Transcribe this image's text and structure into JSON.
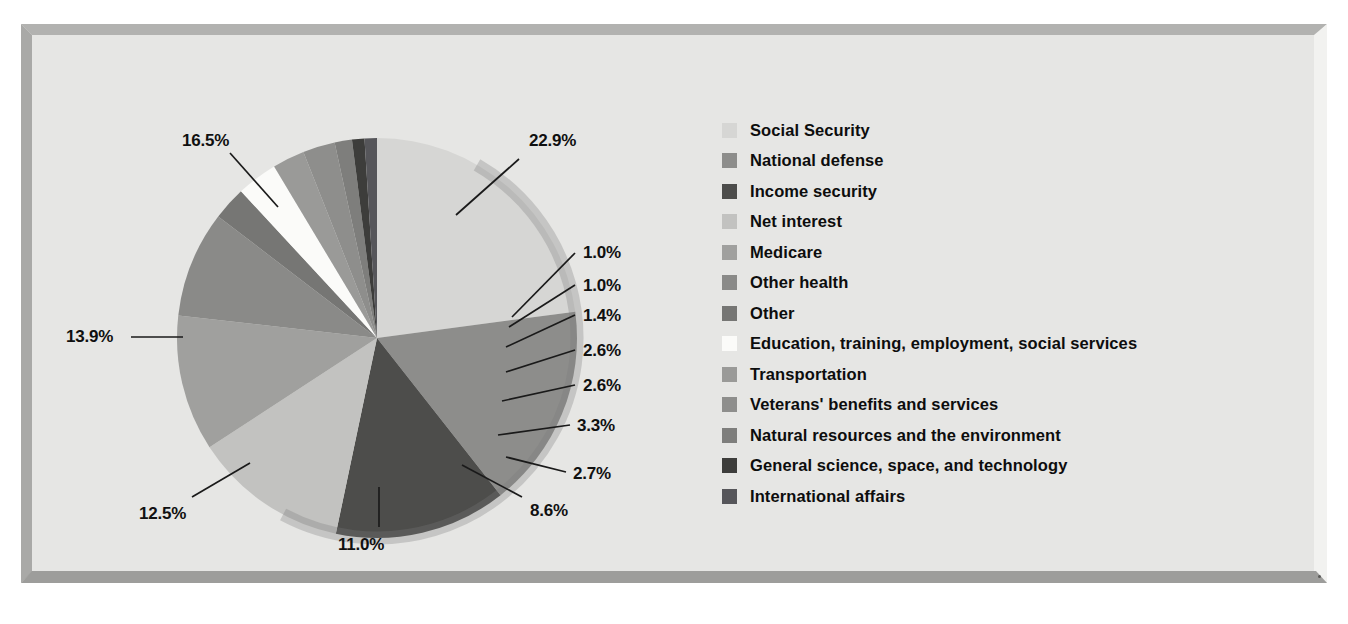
{
  "chart_data": {
    "type": "pie",
    "title": "",
    "legend_position": "right",
    "units": "percent of total federal outlays",
    "categories": [
      "Social Security",
      "National defense",
      "Income security",
      "Net interest",
      "Medicare",
      "Other health",
      "Other",
      "Education, training, employment, social services",
      "Transportation",
      "Veterans' benefits and services",
      "Natural resources and the environment",
      "General science, space, and technology",
      "International affairs"
    ],
    "values": [
      22.9,
      16.5,
      13.9,
      12.5,
      11.0,
      8.6,
      2.7,
      3.3,
      2.6,
      2.6,
      1.4,
      1.0,
      1.0
    ],
    "labels": [
      "22.9%",
      "16.5%",
      "13.9%",
      "12.5%",
      "11.0%",
      "8.6%",
      "2.7%",
      "3.3%",
      "2.6%",
      "2.6%",
      "1.4%",
      "1.0%",
      "1.0%"
    ],
    "colors": [
      "#d6d6d4",
      "#8d8d8b",
      "#4d4d4b",
      "#c2c2c0",
      "#a0a09e",
      "#8a8a88",
      "#767674",
      "#fbfbf9",
      "#9a9a98",
      "#8e8e8c",
      "#7e7e7c",
      "#3d3d3b",
      "#56565a"
    ],
    "start_angle_deg": 0,
    "direction": "clockwise"
  },
  "legend": {
    "items": [
      {
        "label": "Social Security",
        "color": "#d6d6d4"
      },
      {
        "label": "National defense",
        "color": "#8d8d8b"
      },
      {
        "label": "Income security",
        "color": "#4d4d4b"
      },
      {
        "label": "Net interest",
        "color": "#c2c2c0"
      },
      {
        "label": "Medicare",
        "color": "#a0a09e"
      },
      {
        "label": "Other health",
        "color": "#8a8a88"
      },
      {
        "label": "Other",
        "color": "#767674"
      },
      {
        "label": "Education, training, employment, social services",
        "color": "#fbfbf9"
      },
      {
        "label": "Transportation",
        "color": "#9a9a98"
      },
      {
        "label": "Veterans' benefits and services",
        "color": "#8e8e8c"
      },
      {
        "label": "Natural resources and the environment",
        "color": "#7e7e7c"
      },
      {
        "label": "General science, space, and technology",
        "color": "#3d3d3b"
      },
      {
        "label": "International affairs",
        "color": "#56565a"
      }
    ]
  },
  "callouts": [
    {
      "text": "22.9%",
      "x": 497,
      "y": 96,
      "lx1": 487,
      "ly1": 124,
      "lx2": 424,
      "ly2": 180
    },
    {
      "text": "16.5%",
      "x": 150,
      "y": 96,
      "lx1": 198,
      "ly1": 118,
      "lx2": 246,
      "ly2": 172
    },
    {
      "text": "13.9%",
      "x": 34,
      "y": 292,
      "lx1": 99,
      "ly1": 302,
      "lx2": 151,
      "ly2": 302
    },
    {
      "text": "12.5%",
      "x": 107,
      "y": 469,
      "lx1": 160,
      "ly1": 462,
      "lx2": 218,
      "ly2": 428
    },
    {
      "text": "11.0%",
      "x": 306,
      "y": 500,
      "lx1": 347,
      "ly1": 492,
      "lx2": 347,
      "ly2": 452
    },
    {
      "text": "8.6%",
      "x": 498,
      "y": 466,
      "lx1": 490,
      "ly1": 462,
      "lx2": 430,
      "ly2": 430
    },
    {
      "text": "2.7%",
      "x": 541,
      "y": 429,
      "lx1": 534,
      "ly1": 437,
      "lx2": 474,
      "ly2": 422
    },
    {
      "text": "3.3%",
      "x": 545,
      "y": 381,
      "lx1": 538,
      "ly1": 390,
      "lx2": 466,
      "ly2": 400
    },
    {
      "text": "2.6%",
      "x": 551,
      "y": 341,
      "lx1": 543,
      "ly1": 350,
      "lx2": 470,
      "ly2": 366
    },
    {
      "text": "2.6%",
      "x": 551,
      "y": 306,
      "lx1": 543,
      "ly1": 315,
      "lx2": 474,
      "ly2": 337
    },
    {
      "text": "1.4%",
      "x": 551,
      "y": 271,
      "lx1": 543,
      "ly1": 280,
      "lx2": 474,
      "ly2": 312
    },
    {
      "text": "1.0%",
      "x": 551,
      "y": 241,
      "lx1": 543,
      "ly1": 250,
      "lx2": 477,
      "ly2": 292
    },
    {
      "text": "1.0%",
      "x": 551,
      "y": 208,
      "lx1": 543,
      "ly1": 218,
      "lx2": 480,
      "ly2": 282
    }
  ],
  "pie_geometry": {
    "cx": 345,
    "cy": 303,
    "r": 200,
    "rim_color": "#7c7c7a"
  }
}
